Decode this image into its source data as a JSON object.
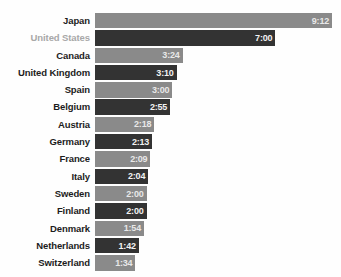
{
  "chart_data": {
    "type": "bar",
    "orientation": "horizontal",
    "title": "",
    "xlabel": "",
    "ylabel": "",
    "grid": false,
    "legend": false,
    "value_format": "h:mm",
    "xlim_minutes": [
      0,
      552
    ],
    "categories": [
      "Japan",
      "United States",
      "Canada",
      "United Kingdom",
      "Spain",
      "Belgium",
      "Austria",
      "Germany",
      "France",
      "Italy",
      "Sweden",
      "Finland",
      "Denmark",
      "Netherlands",
      "Switzerland"
    ],
    "value_labels": [
      "9:12",
      "7:00",
      "3:24",
      "3:10",
      "3:00",
      "2:55",
      "2:18",
      "2:13",
      "2:09",
      "2:04",
      "2:00",
      "2:00",
      "1:54",
      "1:42",
      "1:34"
    ],
    "values_minutes": [
      552,
      420,
      204,
      190,
      180,
      175,
      138,
      133,
      129,
      124,
      120,
      120,
      114,
      102,
      94
    ],
    "bar_styles": [
      "light",
      "dark",
      "light",
      "dark",
      "light",
      "dark",
      "light",
      "dark",
      "light",
      "dark",
      "light",
      "dark",
      "light",
      "dark",
      "light"
    ],
    "label_styles": [
      "normal",
      "muted",
      "normal",
      "normal",
      "normal",
      "normal",
      "normal",
      "normal",
      "normal",
      "normal",
      "normal",
      "normal",
      "normal",
      "normal",
      "normal"
    ],
    "colors": {
      "bar_light": "#8a8a8a",
      "bar_dark": "#333333",
      "label": "#1c1c1c",
      "label_muted": "#a8a8a8",
      "value_text": "#f2f2f2",
      "background": "#fefefe"
    }
  },
  "top_clipped_text": ""
}
